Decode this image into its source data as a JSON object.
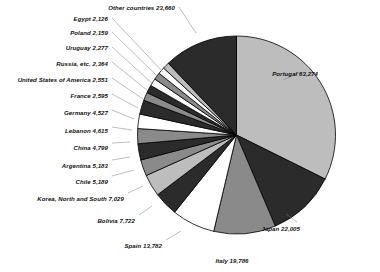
{
  "chart_data": {
    "type": "pie",
    "title": "",
    "subtitle": "",
    "xlabel": "",
    "ylabel": "",
    "legend_position": "callout-labels",
    "grid": false,
    "total": 196208,
    "categories": [
      "Portugal",
      "Japan",
      "Italy",
      "Spain",
      "Bolivia",
      "Korea, North and South",
      "Chile",
      "Argentina",
      "China",
      "Lebanon",
      "Germany",
      "France",
      "United States of America",
      "Russia, etc.",
      "Uruguay",
      "Poland",
      "Egypt",
      "Other countries"
    ],
    "values": [
      63274,
      22005,
      19786,
      13782,
      7722,
      7029,
      5189,
      5183,
      4799,
      4615,
      4527,
      2595,
      2551,
      2364,
      2277,
      2159,
      2126,
      23660
    ],
    "slices": [
      {
        "label": "Portugal 63,274",
        "name": "Portugal",
        "value": 63274,
        "fill": "light"
      },
      {
        "label": "Japan 22,005",
        "name": "Japan",
        "value": 22005,
        "fill": "dark"
      },
      {
        "label": "Italy 19,786",
        "name": "Italy",
        "value": 19786,
        "fill": "medium"
      },
      {
        "label": "Spain 13,782",
        "name": "Spain",
        "value": 13782,
        "fill": "white"
      },
      {
        "label": "Bolivia 7,722",
        "name": "Bolivia",
        "value": 7722,
        "fill": "dark"
      },
      {
        "label": "Korea, North and South 7,029",
        "name": "Korea, North and South",
        "value": 7029,
        "fill": "light"
      },
      {
        "label": "Chile 5,189",
        "name": "Chile",
        "value": 5189,
        "fill": "medium"
      },
      {
        "label": "Argentina 5,183",
        "name": "Argentina",
        "value": 5183,
        "fill": "dark"
      },
      {
        "label": "China 4,799",
        "name": "China",
        "value": 4799,
        "fill": "medium"
      },
      {
        "label": "Lebanon 4,615",
        "name": "Lebanon",
        "value": 4615,
        "fill": "white"
      },
      {
        "label": "Germany 4,527",
        "name": "Germany",
        "value": 4527,
        "fill": "dark"
      },
      {
        "label": "France 2,595",
        "name": "France",
        "value": 2595,
        "fill": "medium"
      },
      {
        "label": "United States of America 2,551",
        "name": "United States of America",
        "value": 2551,
        "fill": "dark"
      },
      {
        "label": "Russia, etc. 2,364",
        "name": "Russia, etc.",
        "value": 2364,
        "fill": "white"
      },
      {
        "label": "Uruguay 2,277",
        "name": "Uruguay",
        "value": 2277,
        "fill": "medium"
      },
      {
        "label": "Poland 2,159",
        "name": "Poland",
        "value": 2159,
        "fill": "white"
      },
      {
        "label": "Egypt 2,126",
        "name": "Egypt",
        "value": 2126,
        "fill": "light"
      },
      {
        "label": "Other countries 23,660",
        "name": "Other countries",
        "value": 23660,
        "fill": "dark"
      }
    ],
    "colors": {
      "light": "#bdbdbd",
      "medium": "#8a8a8a",
      "dark": "#2b2b2b",
      "white": "#ffffff",
      "outline": "#000000",
      "background": "#ffffff",
      "text": "#111111"
    }
  }
}
